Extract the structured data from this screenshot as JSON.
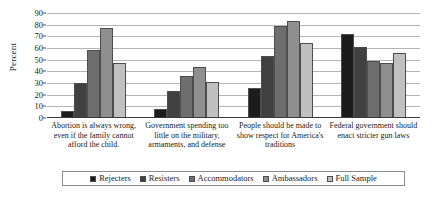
{
  "chart_data": {
    "type": "bar",
    "title": "",
    "xlabel": "",
    "ylabel": "Percent",
    "ylim": [
      0,
      90
    ],
    "yticks": [
      0,
      10,
      20,
      30,
      40,
      50,
      60,
      70,
      80,
      90
    ],
    "grid": true,
    "legend_position": "bottom",
    "categories": [
      "Abortion is always wrong, even if the family cannot afford the child.",
      "Government spending too little on the military, armaments, and defense",
      "People should be made to show respect for America's traditions",
      "Federal government should enact stricter gun laws"
    ],
    "series": [
      {
        "name": "Rejecters",
        "color": "#1c1c1c",
        "values": [
          6,
          8,
          26,
          72
        ]
      },
      {
        "name": "Resisters",
        "color": "#404040",
        "values": [
          30,
          23,
          53,
          61
        ]
      },
      {
        "name": "Accommodators",
        "color": "#6e6e6e",
        "values": [
          58,
          36,
          79,
          49
        ]
      },
      {
        "name": "Ambassadors",
        "color": "#8f8f8f",
        "values": [
          77,
          44,
          83,
          47
        ]
      },
      {
        "name": "Full Sample",
        "color": "#c0c0c0",
        "values": [
          47,
          31,
          64,
          56
        ]
      }
    ]
  }
}
